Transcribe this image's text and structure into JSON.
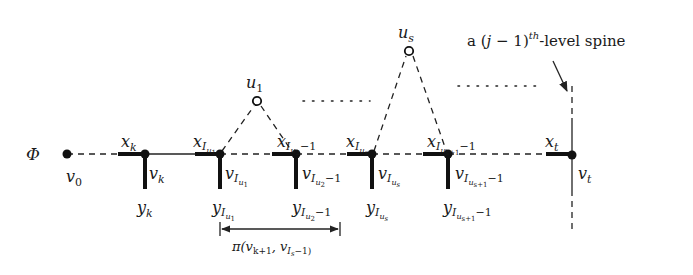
{
  "diagram": {
    "phi_label": "Φ",
    "annotation": {
      "prefix": "a (",
      "j": "j",
      "minus_one": " − 1)",
      "superscript": "th",
      "suffix": "-level spine"
    },
    "nodes": {
      "v0": "v",
      "v0_sub": "0",
      "vk": "v",
      "vk_sub": "k",
      "vt": "v",
      "vt_sub": "t",
      "u1": "u",
      "u1_sub": "1",
      "us": "u",
      "us_sub": "s"
    },
    "spine_labels": {
      "xk": "x",
      "xk_sub": "k",
      "xt": "x",
      "xt_sub": "t",
      "yk": "y",
      "yk_sub": "k",
      "x": "x",
      "y": "y",
      "v": "v",
      "I": "I",
      "u": "u",
      "sub1": "1",
      "sub2": "2",
      "subs": "s",
      "subs1": "s+1",
      "minus1": "−1"
    },
    "arrow_label": "π(v",
    "arrow_label_k1": "k+1",
    "arrow_label_mid": ", v",
    "arrow_label_Is": "I",
    "arrow_label_s": "s",
    "arrow_label_end": "−1)",
    "dotted_gaps": [
      "· · · · · · ·",
      "· · · · · · · ·"
    ]
  }
}
